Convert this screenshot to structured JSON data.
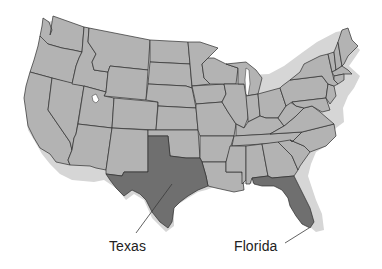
{
  "map": {
    "title": "United States map",
    "colors": {
      "state_fill": "#b3b3b3",
      "highlight_fill": "#6f6f6f",
      "border": "#2e2e2e",
      "shadow": "#d6d6d6",
      "background": "#ffffff"
    },
    "highlighted_states": [
      "Texas",
      "Florida"
    ],
    "labels": [
      {
        "id": "texas",
        "text": "Texas"
      },
      {
        "id": "florida",
        "text": "Florida"
      }
    ]
  }
}
